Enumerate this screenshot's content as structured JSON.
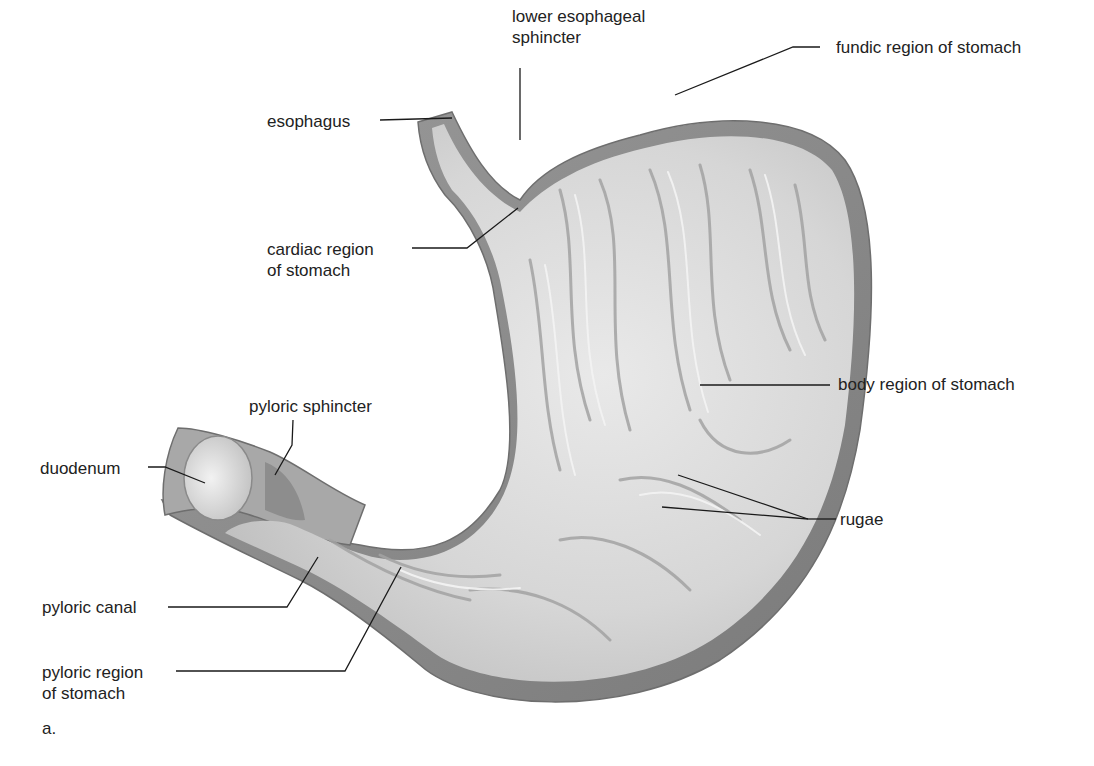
{
  "figure": {
    "panel_label": "a."
  },
  "labels": {
    "lower_esophageal_sphincter": {
      "line1": "lower esophageal",
      "line2": "sphincter"
    },
    "esophagus": {
      "line1": "esophagus"
    },
    "fundic_region": {
      "line1": "fundic region of stomach"
    },
    "cardiac_region": {
      "line1": "cardiac region",
      "line2": "of stomach"
    },
    "body_region": {
      "line1": "body region of stomach"
    },
    "pyloric_sphincter": {
      "line1": "pyloric sphincter"
    },
    "duodenum": {
      "line1": "duodenum"
    },
    "rugae": {
      "line1": "rugae"
    },
    "pyloric_canal": {
      "line1": "pyloric canal"
    },
    "pyloric_region": {
      "line1": "pyloric region",
      "line2": "of stomach"
    }
  },
  "colors": {
    "background": "#ffffff",
    "text": "#222222",
    "leader_line": "#1a1a1a",
    "wall_outer": "#8a8a8a",
    "wall_mid": "#b5b5b5",
    "mucosa": "#d9d9d9",
    "mucosa_highlight": "#efefef",
    "fold_shadow": "#9c9c9c"
  }
}
